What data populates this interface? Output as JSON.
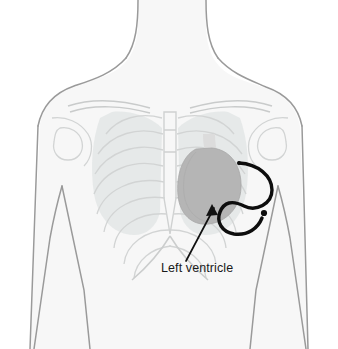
{
  "figure": {
    "background_color": "#ffffff"
  },
  "annotation": {
    "label": "Left ventricle",
    "label_x": 161,
    "label_y": 272,
    "leader_start_x": 186,
    "leader_start_y": 261,
    "leader_end_x": 212,
    "leader_end_y": 206,
    "color": "#111111"
  },
  "anatomy": {
    "body_fill": "#f7f7f7",
    "body_outline": "#9a9a9a",
    "bone_outline": "#d2d4d4",
    "lung_fill": "#e3e6e6",
    "heart_fill": "#b5b5b5",
    "heart_outline": "#a8a8a8",
    "aorta_fill": "#dcdcdc",
    "parts": [
      {
        "name": "neck",
        "label": "Neck"
      },
      {
        "name": "left-shoulder",
        "label": "Shoulder"
      },
      {
        "name": "right-shoulder",
        "label": "Shoulder"
      },
      {
        "name": "left-arm",
        "label": "Arm"
      },
      {
        "name": "right-arm",
        "label": "Arm"
      },
      {
        "name": "clavicle",
        "label": "Clavicle"
      },
      {
        "name": "sternum",
        "label": "Sternum"
      },
      {
        "name": "ribcage",
        "label": "Rib cage"
      },
      {
        "name": "left-lung",
        "label": "Lung"
      },
      {
        "name": "right-lung",
        "label": "Lung"
      },
      {
        "name": "heart",
        "label": "Heart"
      },
      {
        "name": "aorta",
        "label": "Aorta"
      }
    ]
  },
  "device": {
    "name": "cardiac-catheter",
    "label": "Catheter lead",
    "color": "#0d0d0d",
    "stroke_width": 3.4,
    "tip_x": 265,
    "tip_y": 213
  }
}
